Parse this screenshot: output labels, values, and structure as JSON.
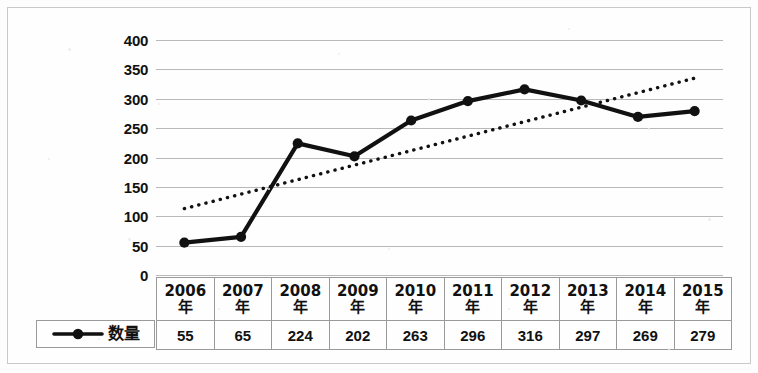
{
  "chart_data": {
    "type": "line",
    "title": "",
    "xlabel": "",
    "ylabel": "",
    "categories": [
      "2006年",
      "2007年",
      "2008年",
      "2009年",
      "2010年",
      "2011年",
      "2012年",
      "2013年",
      "2014年",
      "2015年"
    ],
    "series": [
      {
        "name": "数量",
        "values": [
          55,
          65,
          224,
          202,
          263,
          296,
          316,
          297,
          269,
          279
        ],
        "marker": "filled-circle",
        "color": "#111111",
        "style": "solid"
      },
      {
        "name": "trendline",
        "style": "dotted",
        "color": "#111111",
        "start_value": 113,
        "end_value": 335
      }
    ],
    "ylim": [
      0,
      400
    ],
    "ytick_labels": [
      "0",
      "50",
      "100",
      "150",
      "200",
      "250",
      "300",
      "350",
      "400"
    ],
    "ytick_values": [
      0,
      50,
      100,
      150,
      200,
      250,
      300,
      350,
      400
    ],
    "grid": true,
    "legend_position": "bottom-left",
    "data_table_shown": true
  },
  "axis": {
    "ticks": [
      {
        "label": "400",
        "value": 400
      },
      {
        "label": "350",
        "value": 350
      },
      {
        "label": "300",
        "value": 300
      },
      {
        "label": "250",
        "value": 250
      },
      {
        "label": "200",
        "value": 200
      },
      {
        "label": "150",
        "value": 150
      },
      {
        "label": "100",
        "value": 100
      },
      {
        "label": "50",
        "value": 50
      },
      {
        "label": "0",
        "value": 0
      }
    ]
  },
  "table": {
    "header": [
      {
        "year": "2006",
        "suffix": "年"
      },
      {
        "year": "2007",
        "suffix": "年"
      },
      {
        "year": "2008",
        "suffix": "年"
      },
      {
        "year": "2009",
        "suffix": "年"
      },
      {
        "year": "2010",
        "suffix": "年"
      },
      {
        "year": "2011",
        "suffix": "年"
      },
      {
        "year": "2012",
        "suffix": "年"
      },
      {
        "year": "2013",
        "suffix": "年"
      },
      {
        "year": "2014",
        "suffix": "年"
      },
      {
        "year": "2015",
        "suffix": "年"
      }
    ],
    "values": [
      "55",
      "65",
      "224",
      "202",
      "263",
      "296",
      "316",
      "297",
      "269",
      "279"
    ]
  },
  "legend": {
    "label": "数量"
  },
  "colors": {
    "series": "#111111",
    "gridline": "#b8b8b8",
    "border": "#9a9a9a",
    "frame": "#c9c9c9",
    "background": "#fefefe"
  }
}
